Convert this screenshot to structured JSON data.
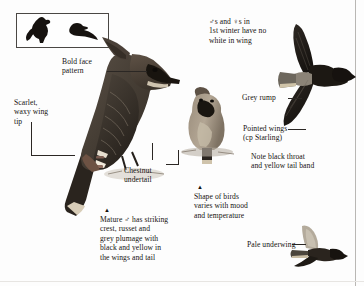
{
  "plate": {
    "title": "Waxwing identification plate",
    "background_color": "#fdfdfd",
    "ink_color": "#15120f"
  },
  "silhouette_box": {
    "name": "flight and perched silhouettes",
    "figure_count": 2,
    "fill_color": "#16120f"
  },
  "labels": {
    "bold_face": "Bold face\npattern",
    "scarlet_wing_tip": "Scarlet,\nwaxy wing\ntip",
    "first_winter": "♂s and ♀s in\n1st winter have no\nwhite in wing",
    "grey_rump": "Grey rump",
    "pointed_wings": "Pointed wings\n(cp Starling)",
    "chestnut_undertail": "Chestnut\nundertail",
    "note_throat": "Note black throat\nand yellow tail band",
    "shape_varies": "Shape of birds\nvaries with mood\nand temperature",
    "mature_male": "Mature ♂ has striking\ncrest, russet and\ngrey plumage with\nblack and yellow in\nthe wings and tail",
    "pale_underwing": "Pale underwing",
    "marker_glyph": "▲"
  },
  "figures": [
    {
      "name": "perched-adult-male-large",
      "pose": "perched, side view, crest raised"
    },
    {
      "name": "perched-bird-front",
      "pose": "perched, front view, fluffed"
    },
    {
      "name": "flying-bird-upperside",
      "pose": "flight, from above"
    },
    {
      "name": "flying-bird-underside",
      "pose": "flight, from below"
    }
  ],
  "palette": {
    "plumage_dark": "#3a332c",
    "plumage_mid": "#6b5f52",
    "plumage_light": "#a79a8b",
    "plumage_pale": "#c9bfb1",
    "black": "#16120f",
    "rule": "#b9b7b4"
  }
}
